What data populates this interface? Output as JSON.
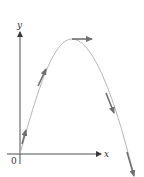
{
  "diagram": {
    "type": "projectile-trajectory",
    "axes": {
      "x_label": "x",
      "y_label": "y",
      "origin_label": "0"
    },
    "colors": {
      "axis": "#3a3a3a",
      "curve": "#b5b5b5",
      "vector": "#6f6f6f"
    },
    "velocity_vectors": [
      {
        "name": "launch-velocity",
        "position": "near-origin",
        "direction": "up-right"
      },
      {
        "name": "rising-velocity",
        "position": "ascending",
        "direction": "up-right"
      },
      {
        "name": "apex-velocity",
        "position": "apex",
        "direction": "horizontal-right"
      },
      {
        "name": "descending-velocity",
        "position": "descending",
        "direction": "down-right"
      },
      {
        "name": "final-velocity",
        "position": "end",
        "direction": "down-right"
      }
    ]
  }
}
